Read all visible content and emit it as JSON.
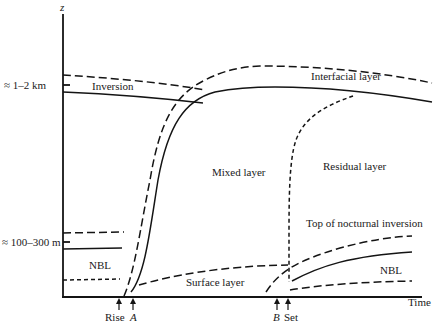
{
  "diagram": {
    "axes": {
      "y_label": "z",
      "x_label": "Time",
      "y_ticks": [
        {
          "label": "≈ 1–2 km"
        },
        {
          "label": "≈ 100–300 m"
        }
      ]
    },
    "regions": {
      "inversion": "Inversion",
      "interfacial": "Interfacial layer",
      "mixed": "Mixed layer",
      "residual": "Residual layer",
      "top_nocturnal": "Top of nocturnal inversion",
      "nbl_left": "NBL",
      "nbl_right": "NBL",
      "surface": "Surface layer"
    },
    "time_markers": [
      {
        "label": "Rise",
        "italic": false
      },
      {
        "label": "A",
        "italic": true
      },
      {
        "label": "B",
        "italic": true
      },
      {
        "label": "Set",
        "italic": false
      }
    ]
  }
}
